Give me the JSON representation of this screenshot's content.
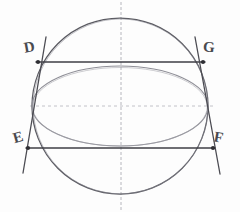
{
  "figure": {
    "background_color": "#fdfdfd",
    "labels": [
      {
        "id": "D",
        "text": "D",
        "x": 24,
        "y": 40,
        "rotation": -10
      },
      {
        "id": "G",
        "text": "G",
        "x": 203,
        "y": 40,
        "rotation": 4
      },
      {
        "id": "E",
        "text": "E",
        "x": 13,
        "y": 130,
        "rotation": -16
      },
      {
        "id": "F",
        "text": "F",
        "x": 214,
        "y": 130,
        "rotation": 10
      }
    ],
    "colors": {
      "circle_stroke": "#55555c",
      "ellipse_stroke": "#8c8c94",
      "chord_stroke": "#3f3f45",
      "slant_stroke": "#4b4b52",
      "axis_stroke": "#b9b9c0",
      "label_color": "#4a4a4f",
      "point_color": "#2e2e33"
    },
    "shapes": {
      "circle": {
        "cx": 120,
        "cy": 106,
        "r": 88
      },
      "ellipse": {
        "cx": 120,
        "cy": 106,
        "rx": 88,
        "ry": 40
      },
      "vertical_axis": {
        "x": 121,
        "y1": 2,
        "y2": 210
      },
      "horizontal_axis": {
        "y": 106,
        "x1": 30,
        "x2": 212
      },
      "chord_DG": {
        "y": 62,
        "x1": 38,
        "x2": 203
      },
      "chord_EF": {
        "y": 148,
        "x1": 28,
        "x2": 213
      },
      "slant_left": {
        "x1": 46,
        "y1": 38,
        "x2": 24,
        "y2": 172
      },
      "slant_right": {
        "x1": 195,
        "y1": 38,
        "x2": 219,
        "y2": 173
      }
    },
    "points": [
      {
        "id": "D",
        "x": 38,
        "y": 62
      },
      {
        "id": "G",
        "x": 203,
        "y": 62
      },
      {
        "id": "E",
        "x": 28,
        "y": 148
      },
      {
        "id": "F",
        "x": 213,
        "y": 148
      }
    ]
  }
}
